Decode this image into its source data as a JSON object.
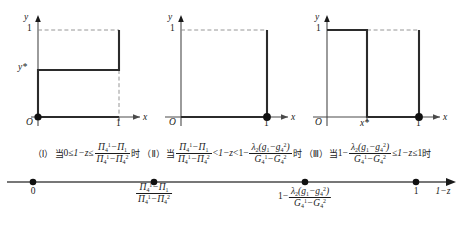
{
  "figure": {
    "axis_labels": {
      "x": "x",
      "y": "y",
      "origin": "O",
      "numberline": "1−z"
    },
    "tick_one": "1"
  },
  "charts": [
    {
      "id": "chart-1",
      "y_ticks": [
        "1",
        "y*"
      ],
      "x_ticks": [
        "1"
      ],
      "origin_dot": true,
      "end_dot": false,
      "description": "step up at x=1 from y* to 1"
    },
    {
      "id": "chart-2",
      "y_ticks": [
        "1"
      ],
      "x_ticks": [
        "1"
      ],
      "origin_dot": false,
      "end_dot": true,
      "description": "zero until x=1 then jumps to 1"
    },
    {
      "id": "chart-3",
      "y_ticks": [
        "1"
      ],
      "x_ticks": [
        "x*",
        "1"
      ],
      "origin_dot": false,
      "end_dot": true,
      "description": "value 1 from 0 to x*, drops to 0, dot at x=1"
    }
  ],
  "conditions": [
    {
      "tag": "（Ⅰ）",
      "when": "当",
      "then": "时",
      "expr_text": "0≤ 1−z ≤ (Π₄¹−Π₁)/(Π₄¹−Π₄²)"
    },
    {
      "tag": "（Ⅱ）",
      "when": "当",
      "then": "时",
      "expr_text": "(Π₄¹−Π₁)/(Π₄¹−Π₄²) < 1−z < 1− λ₂(g₁−g₄²)/(G₄¹−G₄²)"
    },
    {
      "tag": "（Ⅲ）",
      "when": "当",
      "then": "时",
      "expr_text": "1− λ₂(g₁−g₄²)/(G₄¹−G₄²) ≤ 1−z ≤ 1"
    }
  ],
  "symbols": {
    "Pi": "Π",
    "lambda": "λ",
    "G": "G",
    "g": "g",
    "le": "≤",
    "lt": "<",
    "zero": "0",
    "one": "1",
    "minus": "−",
    "y_star": "y*",
    "x_star": "x*",
    "one_minus_z": "1−z"
  },
  "number_line": {
    "points": [
      {
        "label_text": "0",
        "type": "plain"
      },
      {
        "label_text": "(Π₄¹−Π₁)/(Π₄¹−Π₄²)",
        "type": "fraction"
      },
      {
        "label_text": "1− λ₂(g₁−g₄²)/(G₄¹−G₄²)",
        "type": "one-minus-fraction"
      },
      {
        "label_text": "1",
        "type": "plain"
      }
    ],
    "axis_label": "1−z"
  },
  "colors": {
    "ink": "#1a1a1a",
    "curve": "#2b2b2b",
    "dashed": "#8a8a8a",
    "axis": "#4a4a4a"
  }
}
